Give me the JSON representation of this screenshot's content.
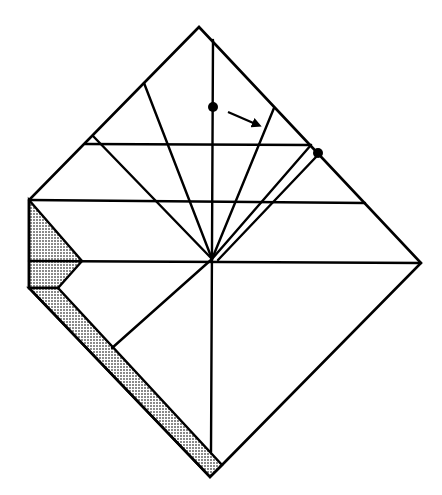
{
  "diagram": {
    "type": "origami-fold-diagram",
    "colors": {
      "line": "#000000",
      "background": "#ffffff",
      "shading": "#c8c8c8"
    },
    "outline": [
      [
        199,
        27
      ],
      [
        421,
        263
      ],
      [
        222,
        465
      ],
      [
        210,
        477
      ],
      [
        29,
        288
      ],
      [
        29,
        200
      ]
    ],
    "shaded_regions": [
      {
        "name": "left-flap",
        "points": [
          [
            29,
            200
          ],
          [
            82,
            261
          ],
          [
            58,
            288
          ],
          [
            29,
            288
          ]
        ]
      },
      {
        "name": "bottom-strip",
        "points": [
          [
            29,
            288
          ],
          [
            58,
            288
          ],
          [
            222,
            465
          ],
          [
            210,
            477
          ]
        ]
      }
    ],
    "center": [
      212,
      259
    ],
    "crease_lines": [
      {
        "name": "vertical-center-crease",
        "from": [
          213,
          40
        ],
        "to": [
          211,
          452
        ]
      },
      {
        "name": "horizontal-crease-top",
        "from": [
          85,
          144
        ],
        "to": [
          311,
          145
        ]
      },
      {
        "name": "horizontal-crease-mid",
        "from": [
          29,
          200
        ],
        "to": [
          365,
          203
        ]
      },
      {
        "name": "horizontal-crease-lower",
        "from": [
          29,
          261
        ],
        "to": [
          421,
          263
        ]
      },
      {
        "name": "radial-crease-1",
        "from": [
          93,
          136
        ],
        "to": [
          212,
          259
        ]
      },
      {
        "name": "radial-crease-2",
        "from": [
          144,
          83
        ],
        "to": [
          212,
          259
        ]
      },
      {
        "name": "radial-crease-3",
        "from": [
          274,
          108
        ],
        "to": [
          212,
          259
        ]
      },
      {
        "name": "radial-crease-4",
        "from": [
          311,
          145
        ],
        "to": [
          212,
          259
        ]
      },
      {
        "name": "radial-crease-5",
        "from": [
          316,
          157
        ],
        "to": [
          218,
          260
        ]
      },
      {
        "name": "lower-left-crease",
        "from": [
          212,
          259
        ],
        "to": [
          112,
          348
        ]
      }
    ],
    "markers": [
      {
        "name": "reference-dot-1",
        "cx": 213,
        "cy": 107,
        "r": 5
      },
      {
        "name": "reference-dot-2",
        "cx": 318,
        "cy": 153,
        "r": 5
      }
    ],
    "arrow": {
      "name": "fold-arrow",
      "from": [
        228,
        112
      ],
      "to": [
        258,
        125
      ]
    }
  }
}
